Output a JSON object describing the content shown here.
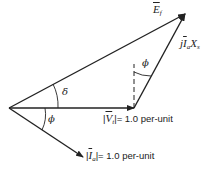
{
  "diagram": {
    "type": "phasor-diagram",
    "labels": {
      "ef": {
        "symbol": "E",
        "sub": "f"
      },
      "jiaxs": {
        "prefix": "j",
        "symbol": "I",
        "sub": "a",
        "suffix": "X",
        "suffix_sub": "s"
      },
      "vt": {
        "symbol": "V",
        "sub": "t",
        "value": "= 1.0 per-unit"
      },
      "ia": {
        "symbol": "I",
        "sub": "a",
        "value": "= 1.0 per-unit"
      },
      "delta": "δ",
      "phi_upper": "ϕ",
      "phi_lower": "ϕ"
    },
    "colors": {
      "line": "#222222",
      "background": "#ffffff"
    }
  }
}
